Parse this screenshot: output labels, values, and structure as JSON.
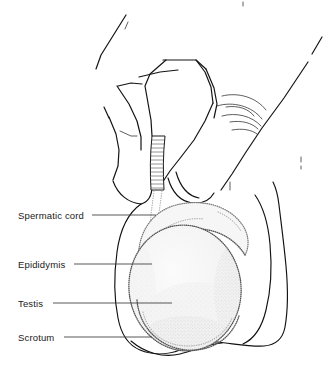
{
  "figure": {
    "background_color": "#ffffff",
    "width": 335,
    "height": 374,
    "style": "line-art medical illustration, stippled shading"
  },
  "labels": [
    {
      "id": "spermatic-cord",
      "text": "Spermatic cord",
      "text_x": 18,
      "text_y": 219,
      "leader_x1": 92,
      "leader_y1": 215,
      "leader_x2": 156,
      "leader_y2": 215
    },
    {
      "id": "epididymis",
      "text": "Epididymis",
      "text_x": 18,
      "text_y": 268,
      "leader_x1": 74,
      "leader_y1": 264,
      "leader_x2": 152,
      "leader_y2": 264
    },
    {
      "id": "testis",
      "text": "Testis",
      "text_x": 18,
      "text_y": 307,
      "leader_x1": 53,
      "leader_y1": 303,
      "leader_x2": 172,
      "leader_y2": 303
    },
    {
      "id": "scrotum",
      "text": "Scrotum",
      "text_x": 18,
      "text_y": 341,
      "leader_x1": 64,
      "leader_y1": 337,
      "leader_x2": 152,
      "leader_y2": 337
    }
  ],
  "structures": {
    "spermatic_cord": {
      "name": "Spermatic cord",
      "description": "ribbed tubular cord descending between the fingers"
    },
    "epididymis": {
      "name": "Epididymis",
      "description": "crescent-shaped stippled structure capping the posterolateral testis"
    },
    "testis": {
      "name": "Testis",
      "description": "large ovoid organ with stippled border and pale interior"
    },
    "scrotum": {
      "name": "Scrotum",
      "description": "outer sac contour enclosing testis and epididymis"
    },
    "hand": {
      "name": "Examining hand",
      "description": "fingers and thumb grasping the scrotum from above"
    }
  },
  "colors": {
    "ink": "#111111",
    "ink_soft": "#3a3a3a",
    "stipple": "#7a7a7a",
    "organ_fill": "#f3f3f3",
    "background": "#ffffff"
  }
}
